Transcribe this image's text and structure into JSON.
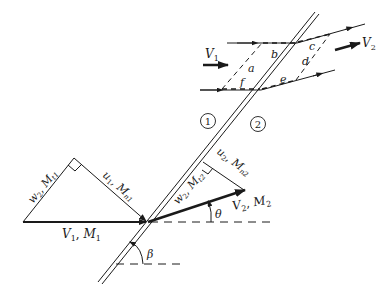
{
  "figure": {
    "type": "oblique-shock-wave-diagram",
    "regions": {
      "upstream": "1",
      "downstream": "2"
    },
    "flow_labels": {
      "upstream_velocity": "V",
      "upstream_velocity_sub": "1",
      "downstream_velocity": "V",
      "downstream_velocity_sub": "2"
    },
    "control_volume_faces": [
      "a",
      "b",
      "c",
      "d",
      "e",
      "f"
    ],
    "upstream_triangle": {
      "tangential": {
        "sym": "w",
        "sub": "2",
        "mach": "M",
        "mach_sub": "t1"
      },
      "normal": {
        "sym": "u",
        "sub": "1",
        "mach": "M",
        "mach_sub": "n1"
      },
      "resultant": {
        "sym": "V",
        "sub": "1",
        "mach": "M",
        "mach_sub": "1"
      }
    },
    "downstream_triangle": {
      "tangential": {
        "sym": "w",
        "sub": "2",
        "mach": "M",
        "mach_sub": "t2"
      },
      "normal": {
        "sym": "u",
        "sub": "2",
        "mach": "M",
        "mach_sub": "n2"
      },
      "resultant": {
        "sym": "V",
        "sub": "2",
        "mach": "M",
        "mach_sub": "2"
      }
    },
    "angles": {
      "deflection": "θ",
      "wave": "β"
    },
    "separator": ", "
  }
}
